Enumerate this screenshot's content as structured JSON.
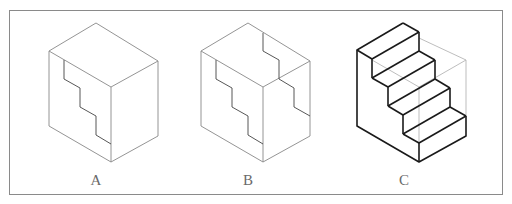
{
  "figure": {
    "panels": [
      {
        "id": "A",
        "label": "A",
        "description": "Cube with stepped staircase line on left face"
      },
      {
        "id": "B",
        "label": "B",
        "description": "Cube with stepped lines on left face, top face and right face"
      },
      {
        "id": "C",
        "label": "C",
        "description": "Staircase solid with four steps inside wireframe cube"
      }
    ],
    "colors": {
      "thin_line": "#888888",
      "bold_line": "#1a1a1a",
      "hidden_line": "#b5b5b5",
      "frame": "#8a8a8a",
      "label": "#6a6a6a"
    }
  }
}
